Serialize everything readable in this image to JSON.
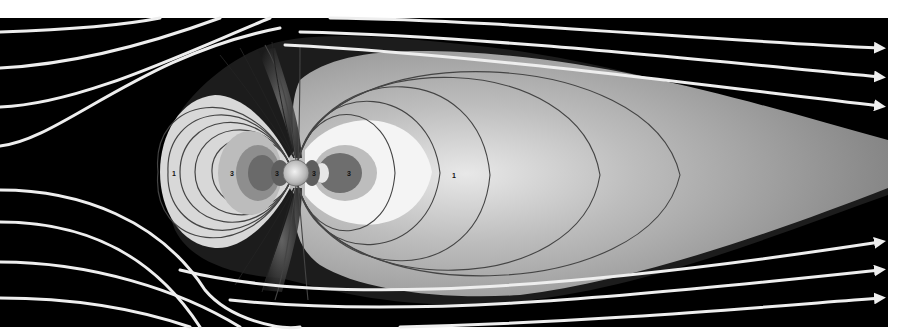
{
  "diagram": {
    "colors": {
      "background": "#ffffff",
      "space": "#000000",
      "solar_wind_lines": "#eeeeee",
      "tail_gray": "#8a8a8a",
      "field_lines": "#444444"
    },
    "zone_labels": [
      {
        "id": "dayside-outer",
        "text": "1",
        "x": 172,
        "y": 176
      },
      {
        "id": "dayside-inner-1",
        "text": "3",
        "x": 232,
        "y": 176
      },
      {
        "id": "dayside-inner-2",
        "text": "3",
        "x": 277,
        "y": 176
      },
      {
        "id": "nightside-inner-1",
        "text": "3",
        "x": 314,
        "y": 176
      },
      {
        "id": "nightside-inner-2",
        "text": "3",
        "x": 349,
        "y": 176
      },
      {
        "id": "nightside-outer",
        "text": "1",
        "x": 453,
        "y": 178
      }
    ],
    "arrow_count_top": 3,
    "arrow_count_bottom": 3
  }
}
